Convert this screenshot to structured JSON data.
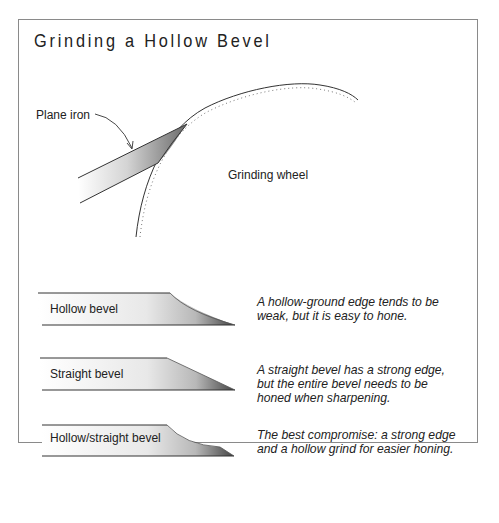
{
  "title": "Grinding a Hollow Bevel",
  "diagram": {
    "plane_iron_label": "Plane iron",
    "grinding_wheel_label": "Grinding wheel"
  },
  "bevels": [
    {
      "label": "Hollow bevel",
      "description": "A hollow-ground edge tends to be weak, but it is easy to hone."
    },
    {
      "label": "Straight bevel",
      "description": "A straight bevel has a strong edge, but the entire bevel needs to be honed when sharpening."
    },
    {
      "label": "Hollow/straight bevel",
      "description": "The best compromise: a strong edge and a hollow grind for easier honing."
    }
  ],
  "colors": {
    "ink": "#222222",
    "border": "#8a8a8a"
  }
}
